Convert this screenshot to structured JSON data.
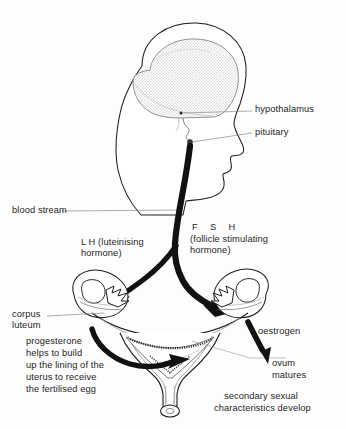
{
  "diagram": {
    "background_color": "#fdfdfd",
    "ink_color": "#1d1d1d",
    "brain_fill": "#e3e3e3",
    "vessel_color": "#111111"
  },
  "labels": {
    "hypothalamus": "hypothalamus",
    "pituitary": "pituitary",
    "blood_stream": "blood stream",
    "lh_line1": "L H (luteinising",
    "lh_line2": "hormone)",
    "fsh_line1": "F  S  H",
    "fsh_line2": "(follicle stimulating",
    "fsh_line3": "hormone)",
    "corpus_line1": "corpus",
    "corpus_line2": "luteum",
    "progesterone_line1": "progesterone",
    "progesterone_line2": "helps to build",
    "progesterone_line3": "up the lining of the",
    "progesterone_line4": "uterus to receive",
    "progesterone_line5": "the fertilised egg",
    "oestrogen": "oestrogen",
    "ovum_line1": "ovum",
    "ovum_line2": "matures",
    "secondary_line1": "secondary sexual",
    "secondary_line2": "characteristics develop"
  },
  "parts": {
    "head_profile": "head-profile",
    "brain": "brain",
    "hypothalamus_marker": "hypothalamus-marker",
    "pituitary_marker": "pituitary-marker",
    "blood_vessel": "blood-vessel",
    "left_ovary": "left-ovary",
    "right_ovary": "right-ovary",
    "uterus": "uterus",
    "fallopian_tubes": "fallopian-tubes",
    "cervix": "cervix",
    "vagina": "vagina",
    "lh_arrow": "lh-arrow",
    "fsh_arrow": "fsh-arrow",
    "progesterone_arrow": "progesterone-arrow",
    "oestrogen_arrow": "oestrogen-arrow"
  }
}
